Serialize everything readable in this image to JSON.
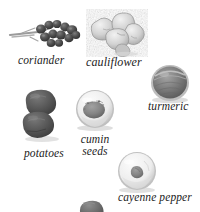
{
  "figure": {
    "background_color": "#ffffff",
    "palette": {
      "caption_text": "#1c1c1c",
      "coriander_dark": "#4a4a4a",
      "coriander_stem": "#8d8d8d",
      "cauliflower_light": "#d8d8d8",
      "cauliflower_shade": "#9a9a9a",
      "turmeric_mid": "#7e7e7e",
      "turmeric_rim": "#b4b4b4",
      "potato_dark": "#565656",
      "bowl_light": "#eeeeee",
      "bowl_rim": "#bdbdbd",
      "cumin_mound": "#8a8a8a",
      "cayenne_mound": "#898989",
      "shadow": "#cfcfcf"
    },
    "items": [
      {
        "id": "coriander",
        "label": "coriander",
        "icon": "coriander-seed-cluster-icon",
        "label_lines": [
          "coriander"
        ]
      },
      {
        "id": "cauliflower",
        "label": "cauliflower",
        "icon": "cauliflower-florets-icon",
        "label_lines": [
          "cauliflower"
        ]
      },
      {
        "id": "turmeric",
        "label": "turmeric",
        "icon": "turmeric-mound-icon",
        "label_lines": [
          "turmeric"
        ]
      },
      {
        "id": "potatoes",
        "label": "potatoes",
        "icon": "potatoes-pair-icon",
        "label_lines": [
          "potatoes"
        ]
      },
      {
        "id": "cumin_seeds",
        "label": "cumin seeds",
        "icon": "cumin-seeds-bowl-icon",
        "label_lines": [
          "cumin",
          "seeds"
        ],
        "line_1": "cumin",
        "line_2": "seeds"
      },
      {
        "id": "cayenne_pepper",
        "label": "cayenne pepper",
        "icon": "cayenne-pepper-bowl-icon",
        "label_lines": [
          "cayenne pepper"
        ]
      },
      {
        "id": "cropped_item",
        "label": "",
        "icon": "cropped-specimen-icon",
        "label_lines": []
      }
    ]
  }
}
